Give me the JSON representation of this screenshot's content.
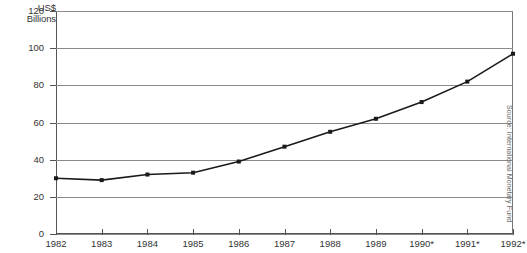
{
  "chart_data": {
    "type": "line",
    "title": "",
    "subtitle": "",
    "xlabel": "",
    "ylabel": "US$ Billions",
    "ylabel_lines": [
      "US$",
      "Billions"
    ],
    "categories": [
      "1982",
      "1983",
      "1984",
      "1985",
      "1986",
      "1987",
      "1988",
      "1989",
      "1990*",
      "1991*",
      "1992*"
    ],
    "values": [
      30,
      29,
      32,
      33,
      39,
      47,
      55,
      62,
      71,
      82,
      97
    ],
    "series": [
      {
        "name": "US$ Billions",
        "values": [
          30,
          29,
          32,
          33,
          39,
          47,
          55,
          62,
          71,
          82,
          97
        ]
      }
    ],
    "yticks": [
      0,
      20,
      40,
      60,
      80,
      100,
      120
    ],
    "ytick_labels": [
      "0",
      "20",
      "40",
      "60",
      "80",
      "100",
      "120"
    ],
    "ylim": [
      0,
      120
    ],
    "xlim": [
      0,
      10
    ],
    "grid": "horizontal",
    "legend": "none",
    "line_color": "#1a1a1a",
    "marker": "square",
    "marker_color": "#1a1a1a",
    "grid_color": "#8a8a8a",
    "axis_color": "#555555",
    "background": "#ffffff",
    "annotations": [
      "Source: International Monetary Fund"
    ],
    "footnote_marker": "*"
  },
  "source_note": "Source: International Monetary Fund"
}
